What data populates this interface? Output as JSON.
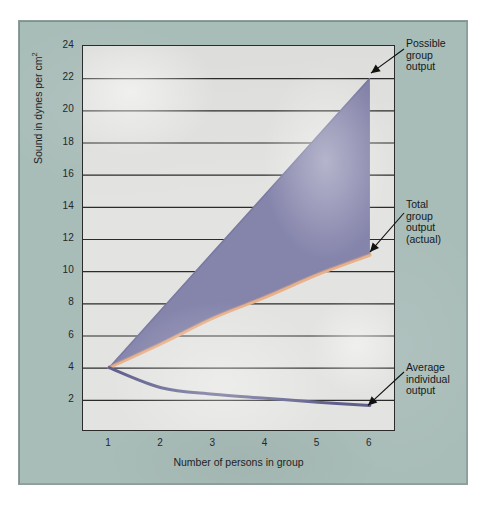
{
  "chart_data": {
    "type": "line",
    "title": "",
    "xlabel": "Number of persons in group",
    "ylabel": "Sound in dynes per cm2",
    "ylabel_base": "Sound in dynes per cm",
    "ylabel_exponent": "2",
    "xlim": [
      0.5,
      6.5
    ],
    "ylim": [
      0,
      24
    ],
    "grid": true,
    "grid_axis": "y",
    "legend": "annotations",
    "xticks": [
      1,
      2,
      3,
      4,
      5,
      6
    ],
    "yticks": [
      2,
      4,
      6,
      8,
      10,
      12,
      14,
      16,
      18,
      20,
      22,
      24
    ],
    "x": [
      1,
      2,
      3,
      4,
      5,
      6
    ],
    "series": [
      {
        "name": "Possible group output",
        "values": [
          4,
          7.6,
          11.2,
          14.8,
          18.4,
          22
        ],
        "color": "#8a8ab0"
      },
      {
        "name": "Total group output (actual)",
        "values": [
          4,
          5.5,
          7.1,
          8.4,
          9.8,
          11
        ],
        "color": "#e8b189"
      },
      {
        "name": "Average individual output",
        "values": [
          4,
          2.75,
          2.35,
          2.1,
          1.85,
          1.65
        ],
        "color": "#5f5f8c"
      }
    ],
    "fill": {
      "between": [
        "Possible group output",
        "Total group output (actual)"
      ],
      "color": "#8584ab",
      "label": "productivity loss region"
    },
    "annotations": [
      {
        "id": "possible",
        "text": "Possible\ngroup\noutput",
        "points_to": [
          6,
          22
        ]
      },
      {
        "id": "total",
        "text": "Total\ngroup\noutput\n(actual)",
        "points_to": [
          6,
          11
        ]
      },
      {
        "id": "average",
        "text": "Average\nindividual\noutput",
        "points_to": [
          6,
          1.65
        ]
      }
    ]
  },
  "figure": {
    "panel_color": "#a8bcb8",
    "plot_bg_color": "#e3e4e1",
    "axis_color": "#2b2b2b",
    "text_color": "#1f2325"
  }
}
